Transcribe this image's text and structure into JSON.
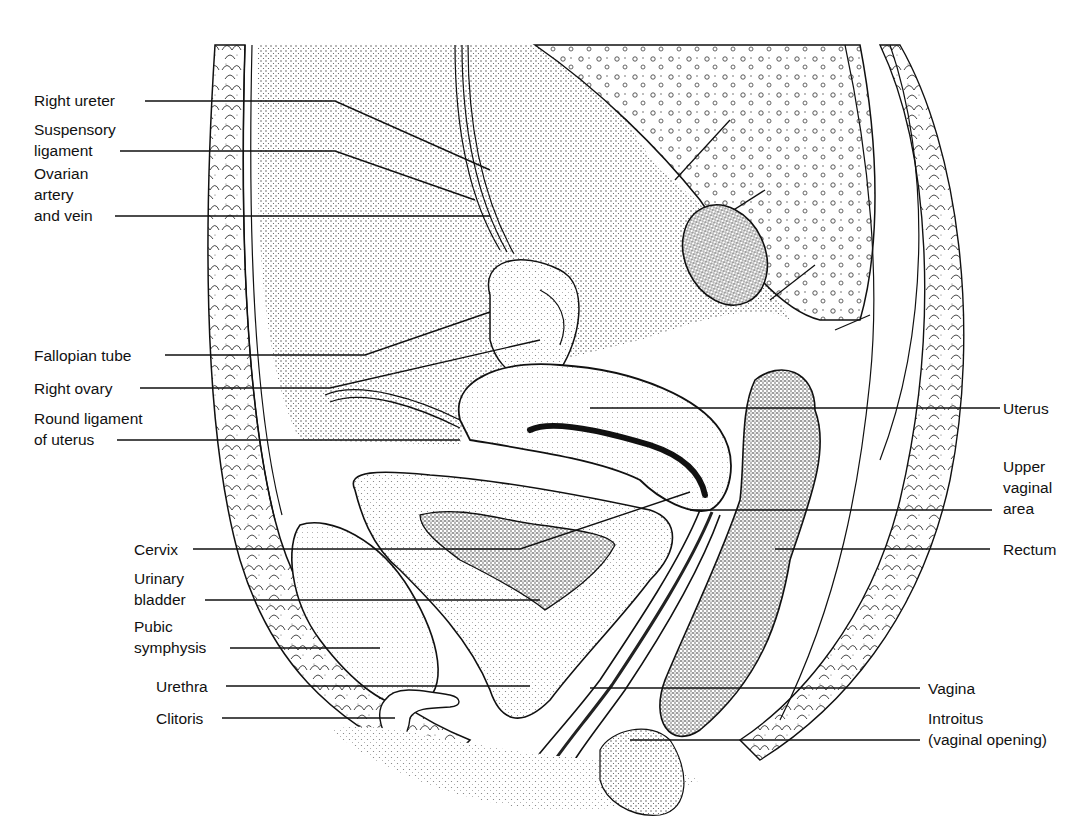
{
  "figure": {
    "type": "anatomical illustration",
    "style": "black-and-white stipple line drawing",
    "colors": {
      "ink": "#111111",
      "background": "#ffffff",
      "stipple_dark": "#3a3a3a",
      "stipple_light": "#9a9a9a"
    }
  },
  "labels": {
    "left": [
      {
        "id": "right-ureter",
        "lines": [
          "Right ureter"
        ]
      },
      {
        "id": "suspensory-ligament",
        "lines": [
          "Suspensory",
          "ligament"
        ]
      },
      {
        "id": "ovarian-artery-vein",
        "lines": [
          "Ovarian",
          "artery",
          "and vein"
        ]
      },
      {
        "id": "fallopian-tube",
        "lines": [
          "Fallopian tube"
        ]
      },
      {
        "id": "right-ovary",
        "lines": [
          "Right ovary"
        ]
      },
      {
        "id": "round-ligament",
        "lines": [
          "Round ligament",
          "of uterus"
        ]
      },
      {
        "id": "cervix",
        "lines": [
          "Cervix"
        ]
      },
      {
        "id": "urinary-bladder",
        "lines": [
          "Urinary",
          "bladder"
        ]
      },
      {
        "id": "pubic-symphysis",
        "lines": [
          "Pubic",
          "symphysis"
        ]
      },
      {
        "id": "urethra",
        "lines": [
          "Urethra"
        ]
      },
      {
        "id": "clitoris",
        "lines": [
          "Clitoris"
        ]
      }
    ],
    "right": [
      {
        "id": "uterus",
        "lines": [
          "Uterus"
        ]
      },
      {
        "id": "upper-vaginal-area",
        "lines": [
          "Upper",
          "vaginal",
          "area"
        ]
      },
      {
        "id": "rectum",
        "lines": [
          "Rectum"
        ]
      },
      {
        "id": "vagina",
        "lines": [
          "Vagina"
        ]
      },
      {
        "id": "introitus",
        "lines": [
          "Introitus",
          "(vaginal opening)"
        ]
      }
    ]
  }
}
